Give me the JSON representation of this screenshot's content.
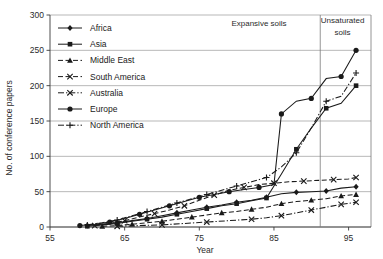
{
  "chart_data": {
    "type": "line",
    "title": "",
    "xlabel": "Year",
    "ylabel": "No. of conference papers",
    "xlim": [
      55,
      98
    ],
    "ylim": [
      0,
      300
    ],
    "xticks": [
      55,
      65,
      75,
      85,
      95
    ],
    "yticks": [
      0,
      50,
      100,
      150,
      200,
      250,
      300
    ],
    "grid": "horizontal",
    "legend_position": "top-left-inside",
    "annotations": [
      {
        "text": "Expansive soils",
        "x": 83,
        "y": 285
      },
      {
        "text": "Unsaturated",
        "x": 94.2,
        "y": 288
      },
      {
        "text": "soils",
        "x": 94.2,
        "y": 272
      },
      {
        "text": "divider",
        "kind": "vline",
        "x": 91.2
      }
    ],
    "series": [
      {
        "name": "Africa",
        "marker": "diamond",
        "dash": "solid",
        "points": [
          [
            60,
            2
          ],
          [
            62,
            4
          ],
          [
            64,
            6
          ],
          [
            66,
            9
          ],
          [
            68,
            12
          ],
          [
            70,
            16
          ],
          [
            72,
            20
          ],
          [
            74,
            24
          ],
          [
            76,
            28
          ],
          [
            78,
            31
          ],
          [
            80,
            35
          ],
          [
            82,
            38
          ],
          [
            84,
            42
          ],
          [
            86,
            47
          ],
          [
            88,
            49
          ],
          [
            90,
            50
          ],
          [
            92,
            51
          ],
          [
            94,
            55
          ],
          [
            96,
            57
          ]
        ]
      },
      {
        "name": "Asia",
        "marker": "square",
        "dash": "solid",
        "points": [
          [
            60,
            1
          ],
          [
            62,
            3
          ],
          [
            64,
            5
          ],
          [
            66,
            8
          ],
          [
            68,
            11
          ],
          [
            70,
            14
          ],
          [
            72,
            18
          ],
          [
            74,
            22
          ],
          [
            76,
            26
          ],
          [
            78,
            30
          ],
          [
            80,
            33
          ],
          [
            82,
            37
          ],
          [
            84,
            41
          ],
          [
            86,
            75
          ],
          [
            88,
            110
          ],
          [
            90,
            140
          ],
          [
            92,
            168
          ],
          [
            94,
            175
          ],
          [
            96,
            200
          ]
        ]
      },
      {
        "name": "Middle East",
        "marker": "triangle",
        "dash": "dashed",
        "points": [
          [
            62,
            1
          ],
          [
            64,
            2
          ],
          [
            66,
            4
          ],
          [
            68,
            6
          ],
          [
            70,
            8
          ],
          [
            72,
            11
          ],
          [
            74,
            14
          ],
          [
            76,
            17
          ],
          [
            78,
            20
          ],
          [
            80,
            22
          ],
          [
            82,
            25
          ],
          [
            84,
            28
          ],
          [
            86,
            33
          ],
          [
            88,
            36
          ],
          [
            90,
            38
          ],
          [
            92,
            40
          ],
          [
            94,
            44
          ],
          [
            96,
            46
          ]
        ]
      },
      {
        "name": "South America",
        "marker": "cross",
        "dash": "dashed",
        "points": [
          [
            61,
            2
          ],
          [
            63,
            5
          ],
          [
            65,
            9
          ],
          [
            67,
            14
          ],
          [
            69,
            19
          ],
          [
            71,
            24
          ],
          [
            73,
            30
          ],
          [
            75,
            38
          ],
          [
            77,
            45
          ],
          [
            79,
            52
          ],
          [
            81,
            56
          ],
          [
            83,
            60
          ],
          [
            85,
            62
          ],
          [
            87,
            64
          ],
          [
            89,
            65
          ],
          [
            91,
            66
          ],
          [
            93,
            67
          ],
          [
            95,
            68
          ],
          [
            96,
            70
          ]
        ]
      },
      {
        "name": "Australia",
        "marker": "cross",
        "dash": "dashdot",
        "points": [
          [
            64,
            1
          ],
          [
            67,
            2
          ],
          [
            70,
            3
          ],
          [
            73,
            5
          ],
          [
            76,
            7
          ],
          [
            79,
            9
          ],
          [
            82,
            11
          ],
          [
            84,
            13
          ],
          [
            86,
            16
          ],
          [
            88,
            20
          ],
          [
            90,
            24
          ],
          [
            92,
            28
          ],
          [
            94,
            32
          ],
          [
            96,
            35
          ]
        ]
      },
      {
        "name": "Europe",
        "marker": "circle",
        "dash": "solid",
        "points": [
          [
            59,
            2
          ],
          [
            61,
            4
          ],
          [
            63,
            7
          ],
          [
            65,
            12
          ],
          [
            67,
            18
          ],
          [
            69,
            24
          ],
          [
            71,
            30
          ],
          [
            73,
            36
          ],
          [
            75,
            42
          ],
          [
            77,
            46
          ],
          [
            79,
            50
          ],
          [
            81,
            53
          ],
          [
            83,
            56
          ],
          [
            85,
            60
          ],
          [
            86,
            160
          ],
          [
            88,
            178
          ],
          [
            90,
            182
          ],
          [
            92,
            210
          ],
          [
            94,
            213
          ],
          [
            96,
            250
          ]
        ]
      },
      {
        "name": "North America",
        "marker": "plus",
        "dash": "dashdot",
        "points": [
          [
            60,
            3
          ],
          [
            62,
            6
          ],
          [
            64,
            10
          ],
          [
            66,
            16
          ],
          [
            68,
            22
          ],
          [
            70,
            28
          ],
          [
            72,
            34
          ],
          [
            74,
            40
          ],
          [
            76,
            46
          ],
          [
            78,
            52
          ],
          [
            80,
            58
          ],
          [
            82,
            64
          ],
          [
            84,
            70
          ],
          [
            86,
            85
          ],
          [
            88,
            105
          ],
          [
            90,
            140
          ],
          [
            92,
            178
          ],
          [
            94,
            185
          ],
          [
            96,
            218
          ]
        ]
      }
    ]
  },
  "legend": {
    "items": [
      {
        "label": "Africa"
      },
      {
        "label": "Asia"
      },
      {
        "label": "Middle East"
      },
      {
        "label": "South America"
      },
      {
        "label": "Australia"
      },
      {
        "label": "Europe"
      },
      {
        "label": "North America"
      }
    ]
  },
  "colors": {
    "ink": "#1a1a1a",
    "grid": "#9a9a9a",
    "frame": "#7a7a7a",
    "background": "#ffffff"
  }
}
